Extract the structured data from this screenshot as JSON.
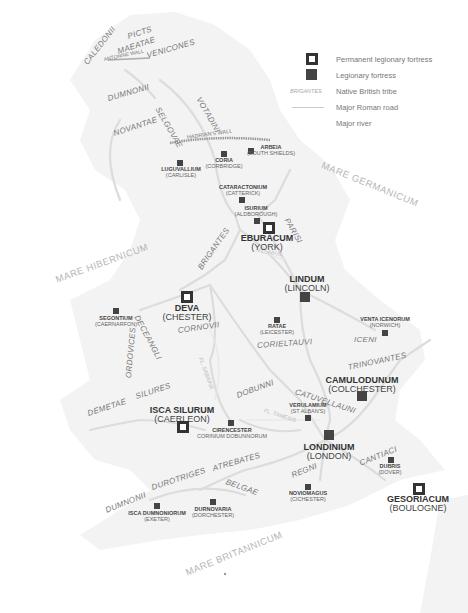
{
  "legend": {
    "items": [
      {
        "symbol": "permanent-fortress-icon",
        "label": "Permanent legionary fortress"
      },
      {
        "symbol": "legionary-fortress-icon",
        "label": "Legionary fortress"
      },
      {
        "symbol_text": "BRIGANTES",
        "label": "Native British tribe"
      },
      {
        "symbol": "road-line-icon",
        "label": "Major Roman road"
      },
      {
        "symbol": "river-line-icon",
        "label": "Major river"
      }
    ]
  },
  "colors": {
    "land": "#f4f4f4",
    "road": "#dcdcdc",
    "fortress": "#444444",
    "wall": "#aaaaaa",
    "text": "#555555"
  },
  "seas": [
    {
      "name": "MARE GERMANICUM"
    },
    {
      "name": "MARE HIBERNICUM"
    },
    {
      "name": "MARE BRITANNICUM"
    }
  ],
  "walls": [
    {
      "name": "ANTONINE WALL"
    },
    {
      "name": "HADRIAN'S WALL"
    }
  ],
  "rivers": [
    {
      "name": "FL. ABUS"
    },
    {
      "name": "FL. SABRINA"
    },
    {
      "name": "FL. TAMESIS"
    }
  ],
  "tribes": [
    {
      "name": "CALEDONII"
    },
    {
      "name": "PICTS"
    },
    {
      "name": "MAEATAE"
    },
    {
      "name": "VENICONES"
    },
    {
      "name": "DUMNONII"
    },
    {
      "name": "VOTADINI"
    },
    {
      "name": "SELGOVAE"
    },
    {
      "name": "NOVANTAE"
    },
    {
      "name": "PARISI"
    },
    {
      "name": "BRIGANTES"
    },
    {
      "name": "DECEANGLI"
    },
    {
      "name": "CORNOVII"
    },
    {
      "name": "ORDOVICES"
    },
    {
      "name": "CORIELTAUVI"
    },
    {
      "name": "ICENI"
    },
    {
      "name": "TRINOVANTES"
    },
    {
      "name": "DEMETAE"
    },
    {
      "name": "SILURES"
    },
    {
      "name": "DOBUNNI"
    },
    {
      "name": "CATUVELLAUNI"
    },
    {
      "name": "ATREBATES"
    },
    {
      "name": "CANTIACI"
    },
    {
      "name": "REGNI"
    },
    {
      "name": "BELGAE"
    },
    {
      "name": "DUROTRIGES"
    },
    {
      "name": "DUMNONII"
    }
  ],
  "towns": [
    {
      "latin": "ARBEIA",
      "modern": "(SOUTH SHIELDS)",
      "type": "fortress"
    },
    {
      "latin": "CORIA",
      "modern": "(CORBRIDGE)",
      "type": "fortress"
    },
    {
      "latin": "LUGUVALLIUM",
      "modern": "(CARLISLE)",
      "type": "fortress"
    },
    {
      "latin": "CATARACTONIUM",
      "modern": "(CATTERICK)",
      "type": "fortress"
    },
    {
      "latin": "ISURIUM",
      "modern": "(ALDBOROUGH)",
      "type": "fortress"
    },
    {
      "latin": "EBURACUM",
      "modern": "(YORK)",
      "type": "permanent"
    },
    {
      "latin": "LINDUM",
      "modern": "(LINCOLN)",
      "type": "fortress-large"
    },
    {
      "latin": "DEVA",
      "modern": "(CHESTER)",
      "type": "permanent"
    },
    {
      "latin": "SEGONTIUM",
      "modern": "(CAERNARFON)",
      "type": "fortress"
    },
    {
      "latin": "RATAE",
      "modern": "(LEICESTER)",
      "type": "fortress"
    },
    {
      "latin": "VENTA ICENORUM",
      "modern": "(NORWICH)",
      "type": "fortress"
    },
    {
      "latin": "CAMULODUNUM",
      "modern": "(COLCHESTER)",
      "type": "fortress-large"
    },
    {
      "latin": "VERULAMIUM",
      "modern": "(ST ALBAN'S)",
      "type": "fortress"
    },
    {
      "latin": "ISCA SILURUM",
      "modern": "(CAERLEON)",
      "type": "permanent"
    },
    {
      "latin": "CIRENCESTER",
      "modern": "CORINIUM DOBUNNORUM",
      "type": "fortress"
    },
    {
      "latin": "LONDINIUM",
      "modern": "(LONDON)",
      "type": "fortress-large"
    },
    {
      "latin": "DUBRIS",
      "modern": "(DOVER)",
      "type": "fortress"
    },
    {
      "latin": "NOVIOMAGUS",
      "modern": "(CICHESTER)",
      "type": "fortress"
    },
    {
      "latin": "ISCA DUMNONIORUM",
      "modern": "(EXETER)",
      "type": "fortress"
    },
    {
      "latin": "DURNOVARIA",
      "modern": "(DORCHESTER)",
      "type": "fortress"
    },
    {
      "latin": "GESORIACUM",
      "modern": "(BOULOGNE)",
      "type": "permanent"
    }
  ]
}
